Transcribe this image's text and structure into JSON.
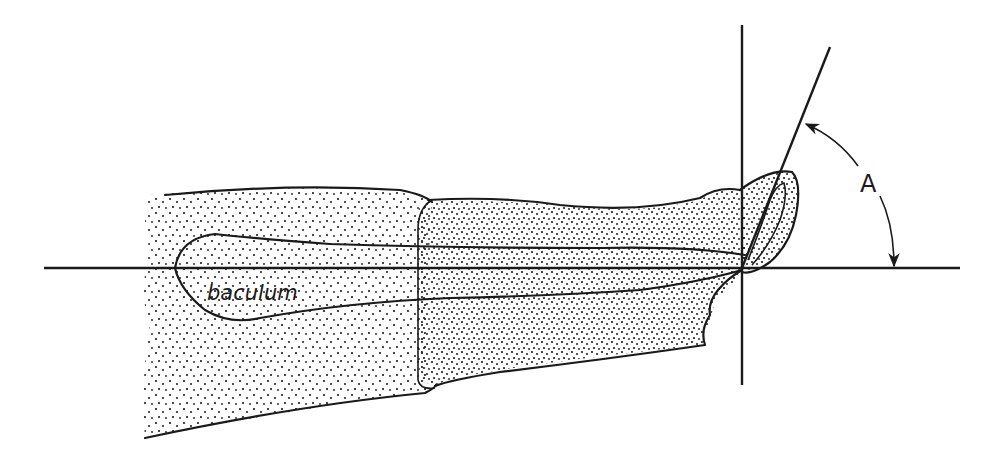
{
  "figure": {
    "labels": {
      "baculum": "baculum",
      "angle": "A"
    },
    "colors": {
      "ink": "#1a1a1a",
      "background": "#ffffff"
    },
    "elements": [
      "horizontal reference line",
      "vertical reference line",
      "inclined tip line",
      "angle arc with arrowheads",
      "stippled glans / penis body",
      "baculum outline"
    ]
  }
}
